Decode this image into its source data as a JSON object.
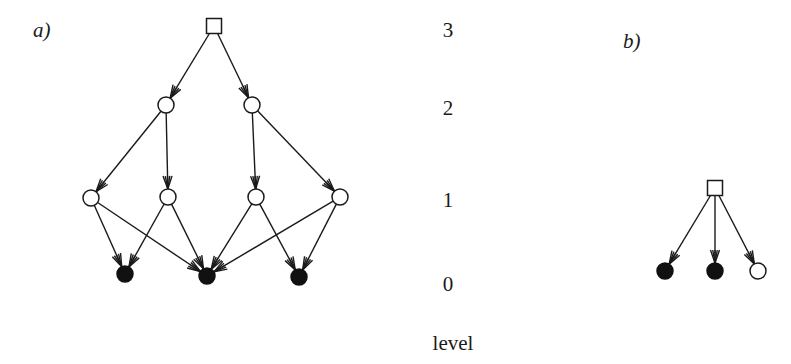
{
  "panels": {
    "a": {
      "label": "a)",
      "root": {
        "id": "r",
        "shape": "square",
        "cx": 214,
        "cy": 26,
        "size": 15
      },
      "nodes": [
        {
          "id": "l2a",
          "level": 2,
          "type": "open",
          "cx": 166,
          "cy": 105
        },
        {
          "id": "l2b",
          "level": 2,
          "type": "open",
          "cx": 252,
          "cy": 105
        },
        {
          "id": "l1a",
          "level": 1,
          "type": "open",
          "cx": 91,
          "cy": 198
        },
        {
          "id": "l1b",
          "level": 1,
          "type": "open",
          "cx": 168,
          "cy": 197
        },
        {
          "id": "l1c",
          "level": 1,
          "type": "open",
          "cx": 256,
          "cy": 197
        },
        {
          "id": "l1d",
          "level": 1,
          "type": "open",
          "cx": 340,
          "cy": 197
        },
        {
          "id": "l0a",
          "level": 0,
          "type": "filled",
          "cx": 125,
          "cy": 274
        },
        {
          "id": "l0b",
          "level": 0,
          "type": "filled",
          "cx": 207,
          "cy": 276
        },
        {
          "id": "l0c",
          "level": 0,
          "type": "filled",
          "cx": 299,
          "cy": 277
        }
      ],
      "edges": [
        [
          "r",
          "l2a"
        ],
        [
          "r",
          "l2b"
        ],
        [
          "l2a",
          "l1a"
        ],
        [
          "l2a",
          "l1b"
        ],
        [
          "l2b",
          "l1c"
        ],
        [
          "l2b",
          "l1d"
        ],
        [
          "l1a",
          "l0a"
        ],
        [
          "l1a",
          "l0b"
        ],
        [
          "l1b",
          "l0a"
        ],
        [
          "l1b",
          "l0b"
        ],
        [
          "l1c",
          "l0b"
        ],
        [
          "l1c",
          "l0c"
        ],
        [
          "l1d",
          "l0b"
        ],
        [
          "l1d",
          "l0c"
        ]
      ]
    },
    "b": {
      "label": "b)",
      "root": {
        "id": "r",
        "shape": "square",
        "cx": 715,
        "cy": 188,
        "size": 15
      },
      "nodes": [
        {
          "id": "b0a",
          "level": 0,
          "type": "filled",
          "cx": 665,
          "cy": 271
        },
        {
          "id": "b0b",
          "level": 0,
          "type": "filled",
          "cx": 715,
          "cy": 271
        },
        {
          "id": "b0c",
          "level": 0,
          "type": "open",
          "cx": 758,
          "cy": 271
        }
      ],
      "edges": [
        [
          "r",
          "b0a"
        ],
        [
          "r",
          "b0b"
        ],
        [
          "r",
          "b0c"
        ]
      ]
    }
  },
  "level_axis": {
    "title": "level",
    "ticks": [
      {
        "label": "3",
        "y": 37
      },
      {
        "label": "2",
        "y": 115
      },
      {
        "label": "1",
        "y": 207
      },
      {
        "label": "0",
        "y": 291
      }
    ]
  },
  "style": {
    "node_radius": 8,
    "stroke_color": "#1a1a1a",
    "background": "#ffffff"
  }
}
